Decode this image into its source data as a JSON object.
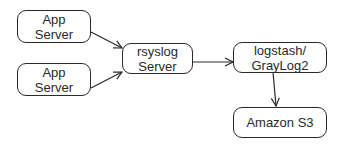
{
  "diagram": {
    "nodes": [
      {
        "id": "app1",
        "lines": [
          "App",
          "Server"
        ]
      },
      {
        "id": "app2",
        "lines": [
          "App",
          "Server"
        ]
      },
      {
        "id": "rsyslog",
        "lines": [
          "rsyslog",
          "Server"
        ]
      },
      {
        "id": "logstash",
        "lines": [
          "logstash/",
          "GrayLog2"
        ]
      },
      {
        "id": "s3",
        "lines": [
          "Amazon S3"
        ]
      }
    ],
    "edges": [
      {
        "from": "app1",
        "to": "rsyslog"
      },
      {
        "from": "app2",
        "to": "rsyslog"
      },
      {
        "from": "rsyslog",
        "to": "logstash"
      },
      {
        "from": "logstash",
        "to": "s3"
      }
    ]
  },
  "colors": {
    "stroke": "#2a2a2a",
    "background": "#ffffff"
  }
}
